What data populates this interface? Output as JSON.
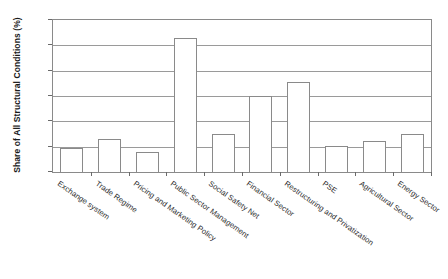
{
  "chart_data": {
    "type": "bar",
    "title": "",
    "xlabel": "",
    "ylabel": "Share of All Structural Conditions (%)",
    "ylim": [
      0,
      30
    ],
    "ytick_values": [
      0,
      5,
      10,
      15,
      20,
      25,
      30
    ],
    "ytick_labels": [
      "0",
      "5",
      "10",
      "15",
      "20",
      "25",
      "30"
    ],
    "grid": true,
    "legend": false,
    "categories": [
      "Exchange system",
      "Trade Regime",
      "Pricing and Marketing Policy",
      "Public Sector Management",
      "Social Safety Net",
      "Financial Sector",
      "Restructuring and Privatization",
      "PSE",
      "Agricultural Sector",
      "Energy Sector"
    ],
    "values": [
      4.7,
      6.6,
      4.0,
      26.5,
      7.5,
      15.0,
      17.8,
      5.2,
      6.2,
      7.5
    ],
    "bar_style": {
      "fill": "#ffffff",
      "edge": "#8a8a8a"
    }
  }
}
